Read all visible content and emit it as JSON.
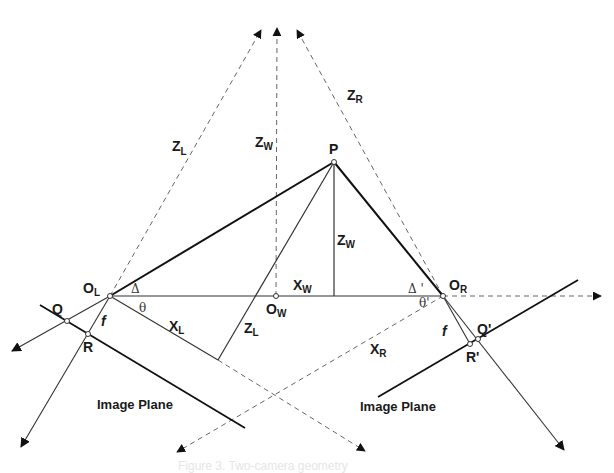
{
  "diagram": {
    "type": "stereo camera geometry",
    "points": {
      "P": "P",
      "O_L": {
        "main": "O",
        "sub": "L"
      },
      "O_W": {
        "main": "O",
        "sub": "W"
      },
      "O_R": {
        "main": "O",
        "sub": "R"
      },
      "Q": "Q",
      "R": "R",
      "Q_prime": "Q'",
      "R_prime": "R'"
    },
    "axis_labels": {
      "Z_L_top": {
        "main": "Z",
        "sub": "L"
      },
      "Z_W_top": {
        "main": "Z",
        "sub": "W"
      },
      "Z_R_top": {
        "main": "Z",
        "sub": "R"
      },
      "Z_W_mid": {
        "main": "Z",
        "sub": "W"
      },
      "X_W": {
        "main": "X",
        "sub": "W"
      },
      "X_L": {
        "main": "X",
        "sub": "L"
      },
      "Z_L_bottom": {
        "main": "Z",
        "sub": "L"
      },
      "X_R": {
        "main": "X",
        "sub": "R"
      }
    },
    "angles": {
      "delta_left": "Δ",
      "theta_left": "θ",
      "delta_right": "Δ '",
      "theta_right": "θ'"
    },
    "focal": {
      "f_left": "f",
      "f_right": "f"
    },
    "planes": {
      "left": "Image  Plane",
      "right": "Image  Plane"
    },
    "caption": "Figure 3. Two-camera geometry",
    "colors": {
      "line": "#1a1a1a",
      "thin_line": "#444444",
      "dashed": "#666666",
      "background": "#ffffff"
    }
  }
}
